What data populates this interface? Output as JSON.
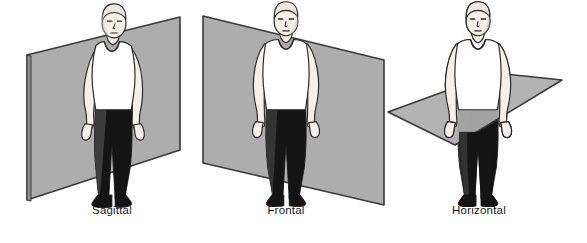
{
  "figure": {
    "background_color": "#FFFFFF",
    "panel_count": 3
  },
  "palette": {
    "plane_fill": "#ADADAD",
    "plane_fill_shaded": "#9E9E9E",
    "plane_edge": "#3A3A3A",
    "outline": "#2B2B2B",
    "skin": "#F4F1EA",
    "skin_shadow": "#C9C4BA",
    "shirt": "#FFFFFF",
    "trousers": "#141414",
    "trousers_shaded": "#5A5A5A",
    "hair": "#E8E4DC",
    "caption_color": "#1A1A1A"
  },
  "panels": [
    {
      "id": "sagittal",
      "label": "Sagittal",
      "label_x": 112,
      "label_y": 214,
      "plane_name": "sagittal-plane",
      "plane_orientation": "vertical-front-to-back",
      "plane_points": "27,55 180,17 180,150 27,200",
      "figure_name": "human-figure-sagittal",
      "figure_view": "three-quarter-left",
      "figure_cx": 113,
      "figure_top": 24,
      "figure_bottom": 200
    },
    {
      "id": "frontal",
      "label": "Frontal",
      "label_x": 286,
      "label_y": 214,
      "plane_name": "frontal-plane",
      "plane_orientation": "vertical-left-to-right",
      "plane_points": "203,16 384,60 384,205 203,163",
      "figure_name": "human-figure-frontal",
      "figure_view": "front",
      "figure_cx": 286,
      "figure_top": 24,
      "figure_bottom": 200
    },
    {
      "id": "horizontal",
      "label": "Horizontal",
      "label_x": 479,
      "label_y": 214,
      "plane_name": "horizontal-plane",
      "plane_orientation": "transverse",
      "plane_points": "388,112 495,73 562,80 455,145",
      "figure_name": "human-figure-horizontal",
      "figure_view": "front",
      "figure_cx": 478,
      "figure_top": 24,
      "figure_bottom": 200
    }
  ],
  "captions": {
    "sagittal": "Sagittal",
    "frontal": "Frontal",
    "horizontal": "Horizontal"
  }
}
